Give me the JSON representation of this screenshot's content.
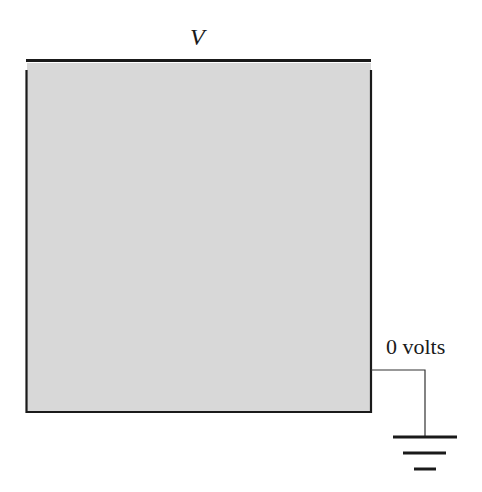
{
  "diagram": {
    "type": "electrostatics-boundary-value-problem",
    "top_plate": {
      "label": "V",
      "description": "Top boundary held at potential V"
    },
    "region": {
      "description": "Gray square region enclosed by grounded walls",
      "fill_color": "#d8d8d8"
    },
    "walls": {
      "label": "0 volts",
      "description": "Left, right, and bottom walls grounded"
    },
    "ground_symbol": {
      "bars": 3
    },
    "colors": {
      "line": "#1a1a1a",
      "fill": "#d8d8d8",
      "background": "#ffffff"
    }
  }
}
